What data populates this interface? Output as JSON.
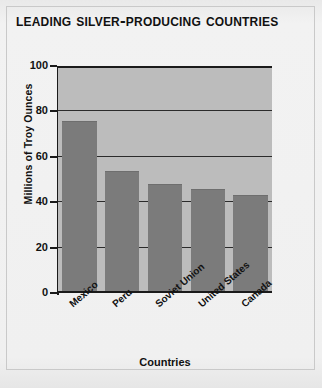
{
  "title": "Leading Silver-Producing Countries",
  "chart_data": {
    "type": "bar",
    "title": "Leading Silver-Producing Countries",
    "xlabel": "Countries",
    "ylabel": "Millions of Troy Ounces",
    "categories": [
      "Mexico",
      "Peru",
      "Soviet Union",
      "United States",
      "Canada"
    ],
    "values": [
      75,
      53,
      47,
      45,
      42.5
    ],
    "ylim": [
      0,
      100
    ],
    "yticks": [
      0,
      20,
      40,
      60,
      80,
      100
    ],
    "ytick_labels": [
      "0",
      "20",
      "40",
      "60",
      "80",
      "100"
    ],
    "grid": true,
    "legend": false,
    "bar_color": "#7b7b7b",
    "plot_background": "#bcbcbc",
    "page_background": "#f1f1f1",
    "axis_color": "#1a1a1a"
  }
}
